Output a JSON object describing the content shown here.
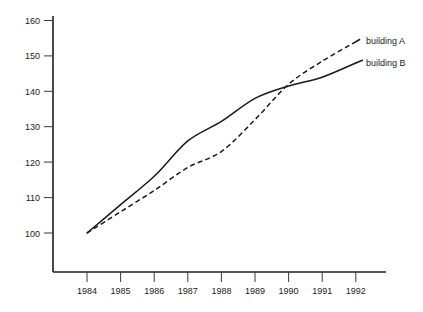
{
  "chart_data": {
    "type": "line",
    "title": "",
    "subtitle": "",
    "xlabel": "",
    "ylabel": "",
    "categories": [
      "1984",
      "1985",
      "1986",
      "1987",
      "1988",
      "1989",
      "1990",
      "1991",
      "1992"
    ],
    "x": [
      1984,
      1985,
      1986,
      1987,
      1988,
      1989,
      1990,
      1991,
      1992
    ],
    "xlim": [
      1983.6,
      1992.6
    ],
    "ylim": [
      93,
      162
    ],
    "yticks": [
      100,
      110,
      120,
      130,
      140,
      150,
      160
    ],
    "ytick_labels": [
      "100",
      "110",
      "120",
      "130",
      "140",
      "150",
      "160"
    ],
    "xticks": [
      1984,
      1985,
      1986,
      1987,
      1988,
      1989,
      1990,
      1991,
      1992
    ],
    "xtick_labels": [
      "1984",
      "1985",
      "1986",
      "1987",
      "1988",
      "1989",
      "1990",
      "1991",
      "1992"
    ],
    "grid": false,
    "legend_position": "right-inline",
    "series": [
      {
        "name": "building A",
        "style": "dashed",
        "color": "#1a1a1a",
        "values": [
          100,
          106,
          112,
          118.5,
          123,
          132,
          142,
          148.5,
          154
        ]
      },
      {
        "name": "building B",
        "style": "solid",
        "color": "#1a1a1a",
        "values": [
          100,
          108,
          116,
          126,
          131.5,
          138,
          141.5,
          144,
          148
        ]
      }
    ],
    "annotations": []
  },
  "legend": {
    "entries": [
      {
        "label": "building A"
      },
      {
        "label": "building B"
      }
    ]
  },
  "axes": {
    "y_labels": [
      "160",
      "150",
      "140",
      "130",
      "120",
      "110",
      "100"
    ],
    "x_labels": [
      "1984",
      "1985",
      "1986",
      "1987",
      "1988",
      "1989",
      "1990",
      "1991",
      "1992"
    ]
  },
  "colors": {
    "background": "#ffffff",
    "axis": "#1f1f1f",
    "line": "#1a1a1a",
    "text": "#1a1a1a"
  }
}
